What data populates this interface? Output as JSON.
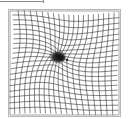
{
  "figure": {
    "type": "amsler-grid",
    "description": "Amsler grid with central distortion and dark scotoma",
    "grid": {
      "columns": 20,
      "rows": 20,
      "x0": 10,
      "y0": 11,
      "x1": 119,
      "y1": 115,
      "line_color": "#3a3a3a",
      "border_color": "#b8b8b8"
    },
    "distortion": {
      "center_x": 58,
      "center_y": 56,
      "radius": 30,
      "strength": 9
    },
    "scotoma": {
      "center_x": 58,
      "center_y": 57,
      "rx": 9,
      "ry": 7,
      "color": "#111111"
    },
    "top_line": {
      "x1": 0,
      "x2": 43,
      "y": 1,
      "color": "#8a8a8a"
    },
    "colors": {
      "background": "#ffffff"
    }
  }
}
